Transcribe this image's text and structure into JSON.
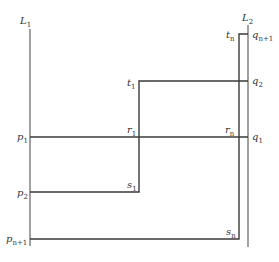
{
  "diagram": {
    "lines": {
      "L1": {
        "label": "L",
        "sub": "1"
      },
      "L2": {
        "label": "L",
        "sub": "2"
      }
    },
    "labels": {
      "p1": {
        "label": "p",
        "sub": "1"
      },
      "p2": {
        "label": "p",
        "sub": "2"
      },
      "pn1": {
        "label": "p",
        "sub": "n+1"
      },
      "q1": {
        "label": "q",
        "sub": "1"
      },
      "q2": {
        "label": "q",
        "sub": "2"
      },
      "qn1": {
        "label": "q",
        "sub": "n+1"
      },
      "t1": {
        "label": "t",
        "sub": "1"
      },
      "tn": {
        "label": "t",
        "sub": "n"
      },
      "r1": {
        "label": "r",
        "sub": "1"
      },
      "rn": {
        "label": "r",
        "sub": "n"
      },
      "s1": {
        "label": "s",
        "sub": "1"
      },
      "sn": {
        "label": "s",
        "sub": "n"
      }
    },
    "stroke_color": "#3a3a3a"
  }
}
